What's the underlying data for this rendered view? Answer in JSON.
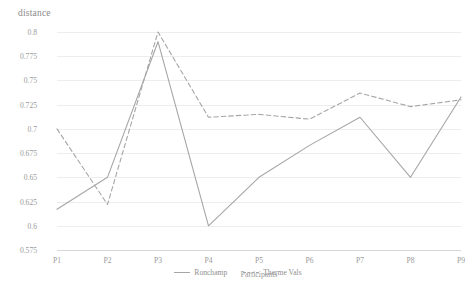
{
  "chart_data": {
    "type": "line",
    "title": "",
    "ylabel": "distance",
    "xlabel": "Participants",
    "categories": [
      "P1",
      "P2",
      "P3",
      "P4",
      "P5",
      "P6",
      "P7",
      "P8",
      "P9"
    ],
    "ylim": [
      0.575,
      0.8
    ],
    "yticks": [
      "0.575",
      "0.6",
      "0.625",
      "0.65",
      "0.675",
      "0.7",
      "0.725",
      "0.75",
      "0.775",
      "0.8"
    ],
    "ytick_values": [
      0.575,
      0.6,
      0.625,
      0.65,
      0.675,
      0.7,
      0.725,
      0.75,
      0.775,
      0.8
    ],
    "grid": true,
    "legend_position": "bottom",
    "series": [
      {
        "name": "Ronchamp",
        "style": "solid",
        "color": "#a6a6a6",
        "values": [
          0.617,
          0.65,
          0.79,
          0.6,
          0.65,
          0.683,
          0.712,
          0.65,
          0.733
        ]
      },
      {
        "name": "Therme Vals",
        "style": "dashed",
        "color": "#a6a6a6",
        "values": [
          0.7,
          0.622,
          0.8,
          0.712,
          0.715,
          0.71,
          0.737,
          0.723,
          0.73
        ]
      }
    ]
  },
  "legend": {
    "items": [
      {
        "label": "Ronchamp",
        "style": "solid"
      },
      {
        "label": "Therme Vals",
        "style": "dashed"
      }
    ]
  }
}
